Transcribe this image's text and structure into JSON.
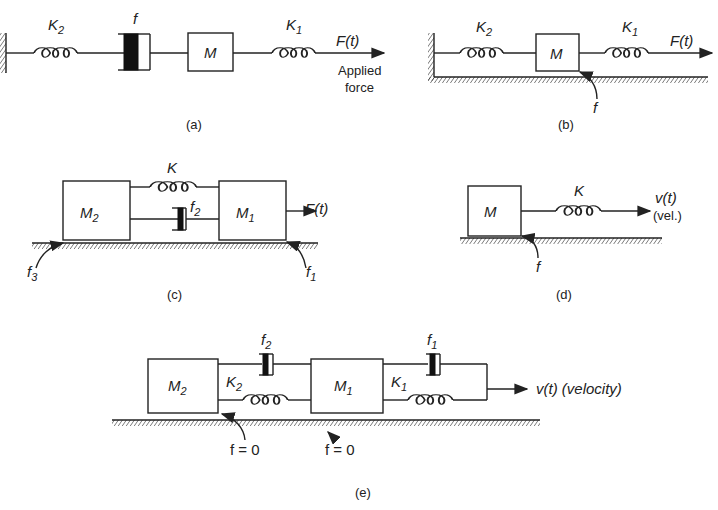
{
  "figures": [
    {
      "id": "a",
      "caption": "(a)",
      "labels": {
        "spring_left": "K",
        "spring_left_sub": "2",
        "damper": "f",
        "mass": "M",
        "spring_right": "K",
        "spring_right_sub": "1",
        "force": "F(t)",
        "force_note_1": "Applied",
        "force_note_2": "force"
      }
    },
    {
      "id": "b",
      "caption": "(b)",
      "labels": {
        "spring_left": "K",
        "spring_left_sub": "2",
        "mass": "M",
        "spring_right": "K",
        "spring_right_sub": "1",
        "force": "F(t)",
        "friction": "f"
      }
    },
    {
      "id": "c",
      "caption": "(c)",
      "labels": {
        "mass_left": "M",
        "mass_left_sub": "2",
        "mass_right": "M",
        "mass_right_sub": "1",
        "spring": "K",
        "damper": "f",
        "damper_sub": "2",
        "force": "F(t)",
        "friction_left": "f",
        "friction_left_sub": "3",
        "friction_right": "f",
        "friction_right_sub": "1"
      }
    },
    {
      "id": "d",
      "caption": "(d)",
      "labels": {
        "mass": "M",
        "spring": "K",
        "input": "v(t)",
        "input_note": "(vel.)",
        "friction": "f"
      }
    },
    {
      "id": "e",
      "caption": "(e)",
      "labels": {
        "mass_left": "M",
        "mass_left_sub": "2",
        "mass_right": "M",
        "mass_right_sub": "1",
        "spring_left": "K",
        "spring_left_sub": "2",
        "spring_right": "K",
        "spring_right_sub": "1",
        "damper_left": "f",
        "damper_left_sub": "2",
        "damper_right": "f",
        "damper_right_sub": "1",
        "input": "v(t) (velocity)",
        "friction_left": "f = 0",
        "friction_right": "f = 0"
      }
    }
  ]
}
